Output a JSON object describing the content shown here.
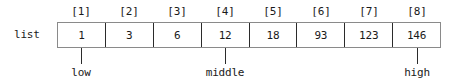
{
  "diagram": {
    "variable_label": "list",
    "index_labels": [
      "[1]",
      "[2]",
      "[3]",
      "[4]",
      "[5]",
      "[6]",
      "[7]",
      "[8]"
    ],
    "cells": [
      {
        "index": "[1]",
        "value": "1"
      },
      {
        "index": "[2]",
        "value": "3"
      },
      {
        "index": "[3]",
        "value": "6"
      },
      {
        "index": "[4]",
        "value": "12"
      },
      {
        "index": "[5]",
        "value": "18"
      },
      {
        "index": "[6]",
        "value": "93"
      },
      {
        "index": "[7]",
        "value": "123"
      },
      {
        "index": "[8]",
        "value": "146"
      }
    ],
    "pointers": [
      {
        "label": "low",
        "cell_index": 1
      },
      {
        "label": "middle",
        "cell_index": 4
      },
      {
        "label": "high",
        "cell_index": 8
      }
    ],
    "colors": {
      "background": "#ffffff",
      "text": "#1a1a1a",
      "outer_border": "#8a8a8a",
      "cell_divider": "#2b2b2b",
      "pointer_line": "#2b2b2b"
    }
  }
}
